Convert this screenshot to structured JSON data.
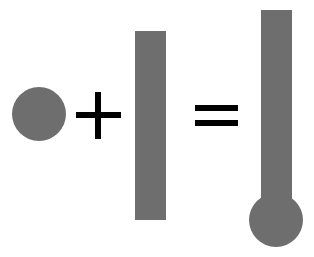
{
  "caption": {
    "text": "",
    "note": "clipped text line at top edge; only descenders visible"
  },
  "diagram": {
    "colors": {
      "shape_fill": "#6e6e6e",
      "operator": "#000000",
      "background": "#ffffff"
    },
    "terms": [
      {
        "id": "circle",
        "shape": "circle",
        "cx": 39,
        "cy": 114,
        "r": 27
      },
      {
        "id": "operator-plus",
        "shape": "plus",
        "symbol": "+"
      },
      {
        "id": "rectangle",
        "shape": "rect",
        "x": 135,
        "y": 31,
        "width": 31,
        "height": 189
      },
      {
        "id": "operator-equals",
        "shape": "equals",
        "symbol": "="
      },
      {
        "id": "thermometer",
        "shape": "rect+circle",
        "rect": {
          "x": 261,
          "y": 10,
          "width": 31,
          "height": 200
        },
        "circle": {
          "cx": 276,
          "cy": 220,
          "r": 27
        }
      }
    ]
  }
}
